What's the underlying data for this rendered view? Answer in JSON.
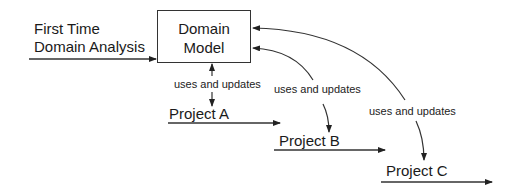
{
  "diagram": {
    "input_label_line1": "First Time",
    "input_label_line2": "Domain Analysis",
    "model_box": {
      "line1": "Domain",
      "line2": "Model"
    },
    "relation_label": "uses and updates",
    "projects": [
      {
        "label": "Project A",
        "relation": "uses and updates"
      },
      {
        "label": "Project B",
        "relation": "uses and updates"
      },
      {
        "label": "Project C",
        "relation": "uses and updates"
      }
    ],
    "colors": {
      "stroke": "#333333",
      "text": "#1a1a1a",
      "background": "#ffffff"
    }
  }
}
